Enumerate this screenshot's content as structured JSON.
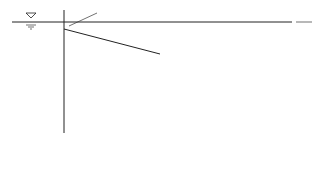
{
  "diagram": {
    "type": "hydraulic energy and hydraulic grade lines along pipe with sections",
    "labels": {
      "h_je": "h",
      "h_je_sub": "je",
      "h_jab": "h",
      "h_jab_sub": "jab",
      "h_f1": "h",
      "h_f1_sub": "f1",
      "h_jbc": "h",
      "h_jbc_sub": "jbc",
      "h_f2": "h",
      "h_f2_sub": "f2",
      "h_jcd": "h",
      "h_jcd_sub": "jcd",
      "velocity_head_1_num": "αv₁²",
      "velocity_head_1_den": "2g",
      "velocity_head_2_num": "αv₂²",
      "velocity_head_2_den": "2g",
      "velocity_head_out_num": "αv²",
      "velocity_head_out_den": "2g",
      "total_loss": "h_wad = Σh_f + Σh_j",
      "v1": "v",
      "v1_sub": "1",
      "v2": "v",
      "v2_sub": "2",
      "point_a": "a",
      "point_b": "b",
      "point_c": "c",
      "point_d": "d"
    },
    "icons": {
      "water_surface": "inverted-triangle-icon",
      "valve": "valve-icon"
    }
  }
}
